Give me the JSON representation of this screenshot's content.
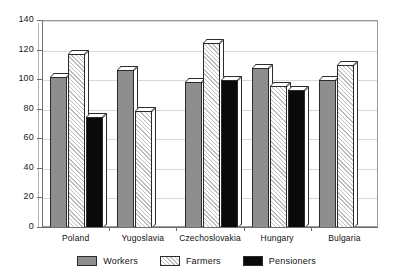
{
  "chart_data": {
    "type": "bar",
    "title": "",
    "subtitle": "",
    "xlabel": "",
    "ylabel": "",
    "categories": [
      "Poland",
      "Yugoslavia",
      "Czechoslovakia",
      "Hungary",
      "Bulgaria"
    ],
    "series": [
      {
        "name": "Workers",
        "values": [
          102,
          107,
          99,
          108,
          100
        ],
        "color": "#8e8e8e",
        "pattern": "solid-gray"
      },
      {
        "name": "Farmers",
        "values": [
          118,
          79,
          125,
          96,
          110
        ],
        "color": "#ffffff",
        "pattern": "diagonal-hatch"
      },
      {
        "name": "Pensioners",
        "values": [
          75,
          null,
          100,
          93,
          null
        ],
        "color": "#0a0a0a",
        "pattern": "solid-black"
      }
    ],
    "ylim": [
      0,
      140
    ],
    "yticks": [
      0,
      20,
      40,
      60,
      80,
      100,
      120,
      140
    ],
    "ytick_labels": [
      "0",
      "20",
      "40",
      "60",
      "80",
      "100",
      "120",
      "140"
    ],
    "grid": true,
    "grid_axis": "y",
    "legend_position": "bottom",
    "legend_entries": [
      "Workers",
      "Farmers",
      "Pensioners"
    ],
    "annotations": []
  },
  "axes": {
    "y": {
      "ticks": [
        {
          "label": "140",
          "value": 140
        },
        {
          "label": "120",
          "value": 120
        },
        {
          "label": "100",
          "value": 100
        },
        {
          "label": "80",
          "value": 80
        },
        {
          "label": "60",
          "value": 60
        },
        {
          "label": "40",
          "value": 40
        },
        {
          "label": "20",
          "value": 20
        },
        {
          "label": "0",
          "value": 0
        }
      ]
    },
    "x": {
      "ticks": [
        {
          "label": "Poland"
        },
        {
          "label": "Yugoslavia"
        },
        {
          "label": "Czechoslovakia"
        },
        {
          "label": "Hungary"
        },
        {
          "label": "Bulgaria"
        }
      ]
    }
  },
  "legend": {
    "items": [
      {
        "label": "Workers"
      },
      {
        "label": "Farmers"
      },
      {
        "label": "Pensioners"
      }
    ]
  }
}
